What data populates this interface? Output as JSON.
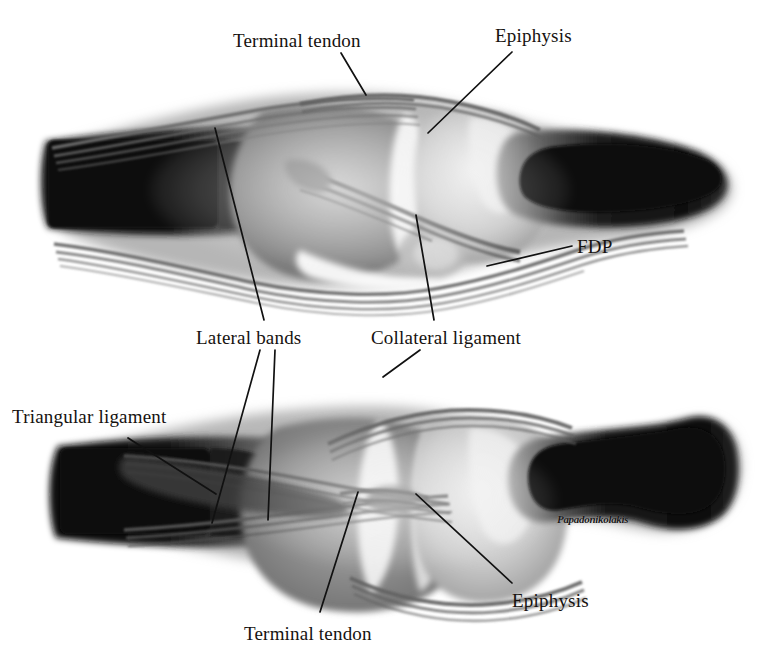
{
  "figure": {
    "background_color": "#ffffff",
    "ink_color": "#16120f",
    "width": 773,
    "height": 659,
    "signature": "Papadonikolakis"
  },
  "panels": [
    {
      "name": "upper-panel",
      "description": "Lateral/sagittal view of distal interphalangeal joint"
    },
    {
      "name": "lower-panel",
      "description": "Dorsal/oblique view of distal interphalangeal joint"
    }
  ],
  "labels": [
    {
      "id": "terminal-tendon-top",
      "text": "Terminal tendon",
      "x": 233,
      "y": 31,
      "panel": "upper-panel"
    },
    {
      "id": "epiphysis-top",
      "text": "Epiphysis",
      "x": 495,
      "y": 26,
      "panel": "upper-panel"
    },
    {
      "id": "fdp",
      "text": "FDP",
      "x": 577,
      "y": 237,
      "panel": "upper-panel"
    },
    {
      "id": "lateral-bands",
      "text": "Lateral bands",
      "x": 196,
      "y": 328,
      "panel": "lower-panel"
    },
    {
      "id": "collateral-ligament",
      "text": "Collateral ligament",
      "x": 371,
      "y": 328,
      "panel": "lower-panel"
    },
    {
      "id": "triangular-ligament",
      "text": "Triangular ligament",
      "x": 12,
      "y": 407,
      "panel": "lower-panel"
    },
    {
      "id": "terminal-tendon-bottom",
      "text": "Terminal tendon",
      "x": 244,
      "y": 624,
      "panel": "lower-panel"
    },
    {
      "id": "epiphysis-bottom",
      "text": "Epiphysis",
      "x": 512,
      "y": 591,
      "panel": "lower-panel"
    }
  ],
  "leader_lines": [
    {
      "id": "leader-terminal-tendon-top",
      "for": "terminal-tendon-top",
      "x1": 341,
      "y1": 53,
      "x2": 366,
      "y2": 95
    },
    {
      "id": "leader-epiphysis-top",
      "for": "epiphysis-top",
      "x1": 512,
      "y1": 52,
      "x2": 428,
      "y2": 133
    },
    {
      "id": "leader-fdp",
      "for": "fdp",
      "x1": 572,
      "y1": 246,
      "x2": 487,
      "y2": 266
    },
    {
      "id": "leader-lateral-bands-a",
      "for": "lateral-bands",
      "x1": 260,
      "y1": 350,
      "x2": 212,
      "y2": 523
    },
    {
      "id": "leader-lateral-bands-b",
      "for": "lateral-bands",
      "x1": 275,
      "y1": 350,
      "x2": 268,
      "y2": 520
    },
    {
      "id": "leader-collateral-ligament",
      "for": "collateral-ligament",
      "x1": 420,
      "y1": 350,
      "x2": 383,
      "y2": 377
    },
    {
      "id": "leader-collateral-upper",
      "for": "collateral-ligament",
      "x1": 416,
      "y1": 215,
      "x2": 434,
      "y2": 320
    },
    {
      "id": "leader-triangular-ligament",
      "for": "triangular-ligament",
      "x1": 128,
      "y1": 438,
      "x2": 216,
      "y2": 494
    },
    {
      "id": "leader-terminal-tendon-bottom",
      "for": "terminal-tendon-bottom",
      "x1": 320,
      "y1": 612,
      "x2": 358,
      "y2": 492
    },
    {
      "id": "leader-epiphysis-bottom",
      "for": "epiphysis-bottom",
      "x1": 512,
      "y1": 583,
      "x2": 416,
      "y2": 494
    },
    {
      "id": "leader-lateral-bands-upper",
      "for": "lateral-bands",
      "x1": 215,
      "y1": 128,
      "x2": 264,
      "y2": 320
    }
  ]
}
